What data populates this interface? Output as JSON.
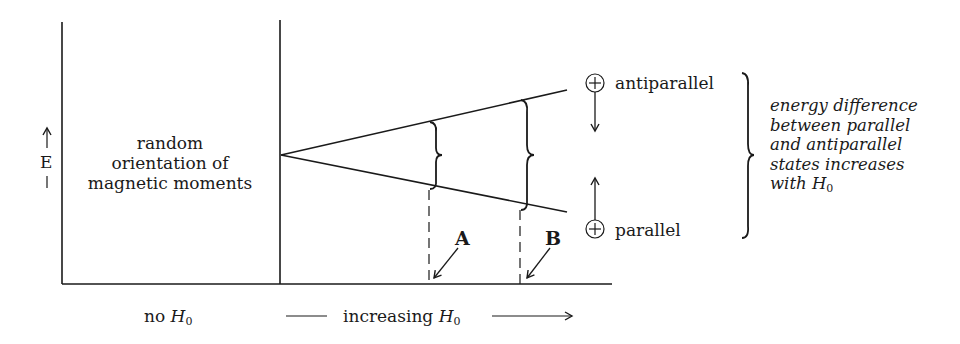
{
  "axis": {
    "y_label": "E",
    "y_arrow": "up"
  },
  "left_region": {
    "lines": [
      "random",
      "orientation of",
      "magnetic moments"
    ],
    "bottom_label_prefix": "no ",
    "bottom_label_var": "H",
    "bottom_label_sub": "0"
  },
  "right_region": {
    "bottom_label_prefix": "increasing ",
    "bottom_label_var": "H",
    "bottom_label_sub": "0"
  },
  "states": {
    "upper": {
      "symbol": "+",
      "label": "antiparallel",
      "arrow": "down"
    },
    "lower": {
      "symbol": "+",
      "label": "parallel",
      "arrow": "up"
    }
  },
  "markers": [
    {
      "label": "A"
    },
    {
      "label": "B"
    }
  ],
  "note": {
    "lines": [
      "energy difference",
      "between parallel",
      "and antiparallel",
      "states increases"
    ],
    "last_prefix": "with ",
    "last_var": "H",
    "last_sub": "0"
  },
  "colors": {
    "ink": "#1a1a1a",
    "background": "#ffffff"
  }
}
